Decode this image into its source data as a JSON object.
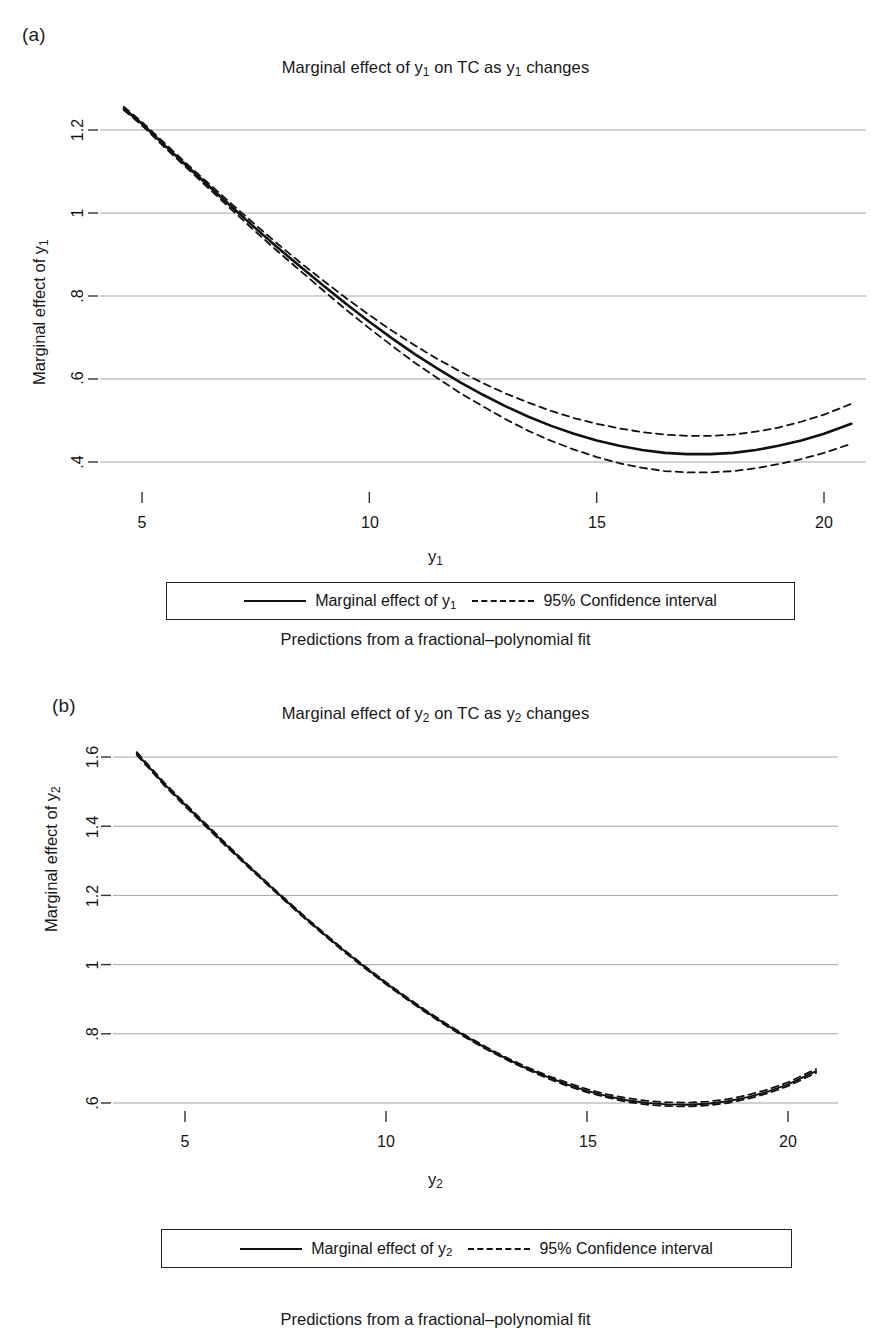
{
  "figure": {
    "panels": [
      {
        "letter": "(a)",
        "title_prefix": "Marginal effect of y",
        "title_sub": "1",
        "title_mid": " on TC as y",
        "title_suffix": " changes",
        "ylabel_prefix": "Marginal effect of y",
        "ylabel_sub": "1",
        "xlabel_prefix": "y",
        "xlabel_sub": "1",
        "note": "Predictions from a fractional–polynomial fit",
        "legend": {
          "solid_prefix": "Marginal effect of y",
          "solid_sub": "1",
          "dashed": "95% Confidence interval"
        },
        "xticks": [
          "5",
          "10",
          "15",
          "20"
        ],
        "yticks": [
          "1.2",
          "1",
          ".8",
          ".6",
          ".4"
        ]
      },
      {
        "letter": "(b)",
        "title_prefix": "Marginal effect of y",
        "title_sub": "2",
        "title_mid": " on TC as y",
        "title_suffix": " changes",
        "ylabel_prefix": "Marginal effect of y",
        "ylabel_sub": "2",
        "xlabel_prefix": "y",
        "xlabel_sub": "2",
        "note": "Predictions from a fractional–polynomial fit",
        "legend": {
          "solid_prefix": "Marginal effect of y",
          "solid_sub": "2",
          "dashed": "95% Confidence interval"
        },
        "xticks": [
          "5",
          "10",
          "15",
          "20"
        ],
        "yticks": [
          "1.6",
          "1.4",
          "1.2",
          "1",
          ".8",
          ".6"
        ]
      }
    ]
  },
  "chart_data": [
    {
      "type": "line",
      "panel": "(a)",
      "title": "Marginal effect of y1 on TC as y1 changes",
      "xlabel": "y1",
      "ylabel": "Marginal effect of y1",
      "note": "Predictions from a fractional–polynomial fit",
      "xlim": [
        4.6,
        20.7
      ],
      "ylim": [
        0.33,
        1.27
      ],
      "xticks": [
        5,
        10,
        15,
        20
      ],
      "yticks": [
        1.2,
        1.0,
        0.8,
        0.6,
        0.4
      ],
      "grid": "horizontal",
      "legend_position": "below-plot",
      "series": [
        {
          "name": "Marginal effect of y1",
          "style": "solid",
          "color": "#111111",
          "x": [
            4.6,
            5,
            5.5,
            6,
            6.5,
            7,
            7.5,
            8,
            8.5,
            9,
            9.5,
            10,
            10.5,
            11,
            11.5,
            12,
            12.5,
            13,
            13.5,
            14,
            14.5,
            15,
            15.5,
            16,
            16.5,
            17,
            17.5,
            18,
            18.5,
            19,
            19.5,
            20,
            20.6
          ],
          "y": [
            1.252,
            1.215,
            1.163,
            1.112,
            1.062,
            1.012,
            0.963,
            0.915,
            0.869,
            0.824,
            0.78,
            0.738,
            0.698,
            0.66,
            0.625,
            0.592,
            0.562,
            0.534,
            0.509,
            0.487,
            0.468,
            0.452,
            0.439,
            0.429,
            0.422,
            0.419,
            0.419,
            0.422,
            0.429,
            0.439,
            0.452,
            0.468,
            0.492
          ]
        },
        {
          "name": "95% Confidence interval (upper)",
          "style": "dashed",
          "color": "#111111",
          "x": [
            4.6,
            5,
            5.5,
            6,
            6.5,
            7,
            7.5,
            8,
            8.5,
            9,
            9.5,
            10,
            10.5,
            11,
            11.5,
            12,
            12.5,
            13,
            13.5,
            14,
            14.5,
            15,
            15.5,
            16,
            16.5,
            17,
            17.5,
            18,
            18.5,
            19,
            19.5,
            20,
            20.6
          ],
          "y": [
            1.256,
            1.219,
            1.168,
            1.117,
            1.068,
            1.019,
            0.971,
            0.924,
            0.879,
            0.836,
            0.794,
            0.754,
            0.716,
            0.681,
            0.648,
            0.618,
            0.59,
            0.565,
            0.543,
            0.523,
            0.506,
            0.492,
            0.481,
            0.472,
            0.466,
            0.463,
            0.463,
            0.466,
            0.473,
            0.483,
            0.497,
            0.514,
            0.54
          ]
        },
        {
          "name": "95% Confidence interval (lower)",
          "style": "dashed",
          "color": "#111111",
          "x": [
            4.6,
            5,
            5.5,
            6,
            6.5,
            7,
            7.5,
            8,
            8.5,
            9,
            9.5,
            10,
            10.5,
            11,
            11.5,
            12,
            12.5,
            13,
            13.5,
            14,
            14.5,
            15,
            15.5,
            16,
            16.5,
            17,
            17.5,
            18,
            18.5,
            19,
            19.5,
            20,
            20.6
          ],
          "y": [
            1.248,
            1.211,
            1.158,
            1.107,
            1.056,
            1.005,
            0.955,
            0.906,
            0.859,
            0.812,
            0.766,
            0.722,
            0.68,
            0.639,
            0.602,
            0.566,
            0.534,
            0.503,
            0.475,
            0.451,
            0.43,
            0.412,
            0.397,
            0.386,
            0.378,
            0.375,
            0.375,
            0.378,
            0.385,
            0.395,
            0.407,
            0.422,
            0.444
          ]
        }
      ]
    },
    {
      "type": "line",
      "panel": "(b)",
      "title": "Marginal effect of y2 on TC as y2 changes",
      "xlabel": "y2",
      "ylabel": "Marginal effect of y2",
      "note": "Predictions from a fractional–polynomial fit",
      "xlim": [
        3.8,
        20.8
      ],
      "ylim": [
        0.53,
        1.63
      ],
      "xticks": [
        5,
        10,
        15,
        20
      ],
      "yticks": [
        1.6,
        1.4,
        1.2,
        1.0,
        0.8,
        0.6
      ],
      "grid": "horizontal",
      "legend_position": "below-plot",
      "series": [
        {
          "name": "Marginal effect of y2",
          "style": "solid",
          "color": "#111111",
          "x": [
            3.8,
            4.5,
            5,
            5.5,
            6,
            6.5,
            7,
            7.5,
            8,
            8.5,
            9,
            9.5,
            10,
            10.5,
            11,
            11.5,
            12,
            12.5,
            13,
            13.5,
            14,
            14.5,
            15,
            15.5,
            16,
            16.5,
            17,
            17.5,
            18,
            18.5,
            19,
            19.5,
            20,
            20.7
          ],
          "y": [
            1.61,
            1.52,
            1.462,
            1.405,
            1.348,
            1.293,
            1.239,
            1.186,
            1.134,
            1.084,
            1.036,
            0.99,
            0.946,
            0.904,
            0.864,
            0.826,
            0.791,
            0.758,
            0.728,
            0.7,
            0.676,
            0.654,
            0.635,
            0.62,
            0.608,
            0.6,
            0.596,
            0.595,
            0.598,
            0.605,
            0.617,
            0.633,
            0.654,
            0.692
          ]
        },
        {
          "name": "95% Confidence interval (upper)",
          "style": "dashed",
          "color": "#111111",
          "x": [
            3.8,
            4.5,
            5,
            5.5,
            6,
            6.5,
            7,
            7.5,
            8,
            8.5,
            9,
            9.5,
            10,
            10.5,
            11,
            11.5,
            12,
            12.5,
            13,
            13.5,
            14,
            14.5,
            15,
            15.5,
            16,
            16.5,
            17,
            17.5,
            18,
            18.5,
            19,
            19.5,
            20,
            20.7
          ],
          "y": [
            1.614,
            1.524,
            1.466,
            1.409,
            1.352,
            1.296,
            1.242,
            1.189,
            1.137,
            1.087,
            1.039,
            0.993,
            0.949,
            0.907,
            0.867,
            0.829,
            0.794,
            0.761,
            0.731,
            0.704,
            0.68,
            0.659,
            0.64,
            0.625,
            0.614,
            0.606,
            0.602,
            0.601,
            0.604,
            0.611,
            0.623,
            0.639,
            0.66,
            0.698
          ]
        },
        {
          "name": "95% Confidence interval (lower)",
          "style": "dashed",
          "color": "#111111",
          "x": [
            3.8,
            4.5,
            5,
            5.5,
            6,
            6.5,
            7,
            7.5,
            8,
            8.5,
            9,
            9.5,
            10,
            10.5,
            11,
            11.5,
            12,
            12.5,
            13,
            13.5,
            14,
            14.5,
            15,
            15.5,
            16,
            16.5,
            17,
            17.5,
            18,
            18.5,
            19,
            19.5,
            20,
            20.7
          ],
          "y": [
            1.606,
            1.516,
            1.458,
            1.401,
            1.344,
            1.29,
            1.236,
            1.183,
            1.131,
            1.081,
            1.033,
            0.987,
            0.943,
            0.901,
            0.861,
            0.823,
            0.788,
            0.755,
            0.725,
            0.697,
            0.672,
            0.65,
            0.631,
            0.616,
            0.603,
            0.595,
            0.591,
            0.59,
            0.593,
            0.6,
            0.612,
            0.628,
            0.649,
            0.687
          ]
        }
      ]
    }
  ]
}
